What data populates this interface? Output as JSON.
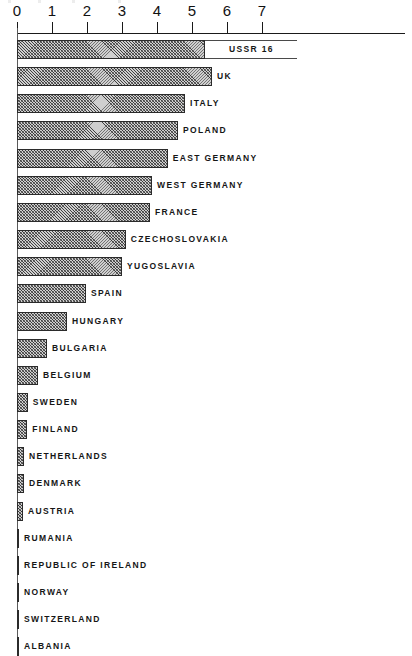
{
  "chart_data": {
    "type": "bar",
    "orientation": "horizontal",
    "title": "",
    "subtitle": "",
    "xlabel": "",
    "ylabel": "",
    "xlim": [
      0,
      7.6
    ],
    "grid": false,
    "legend": null,
    "axis_position": "top",
    "tick_labels": [
      "0",
      "1",
      "2",
      "3",
      "4",
      "5",
      "6",
      "7"
    ],
    "ticks": [
      0,
      1,
      2,
      3,
      4,
      5,
      6,
      7
    ],
    "note": "USSR bar is drawn broken/truncated; its true value 16 is printed as a data label",
    "categories": [
      "USSR",
      "UK",
      "ITALY",
      "POLAND",
      "EAST GERMANY",
      "WEST GERMANY",
      "FRANCE",
      "CZECHOSLOVAKIA",
      "YUGOSLAVIA",
      "SPAIN",
      "HUNGARY",
      "BULGARIA",
      "BELGIUM",
      "SWEDEN",
      "FINLAND",
      "NETHERLANDS",
      "DENMARK",
      "AUSTRIA",
      "RUMANIA",
      "REPUBLIC OF IRELAND",
      "NORWAY",
      "SWITZERLAND",
      "ALBANIA"
    ],
    "values": [
      16.0,
      5.57,
      4.8,
      4.6,
      4.31,
      3.86,
      3.8,
      3.11,
      3.0,
      1.97,
      1.43,
      0.86,
      0.6,
      0.31,
      0.29,
      0.2,
      0.2,
      0.17,
      0.06,
      0.04,
      0.03,
      0.02,
      0.02
    ],
    "bars": [
      {
        "label": "USSR 16",
        "value": 16.0,
        "drawn_value": 5.37,
        "break_end": 8.0,
        "broken": true,
        "label_inside": true
      },
      {
        "label": "UK",
        "value": 5.57,
        "drawn_value": 5.57,
        "broken": false,
        "label_inside": false
      },
      {
        "label": "ITALY",
        "value": 4.8,
        "drawn_value": 4.8,
        "broken": false,
        "label_inside": false
      },
      {
        "label": "POLAND",
        "value": 4.6,
        "drawn_value": 4.6,
        "broken": false,
        "label_inside": false
      },
      {
        "label": "EAST GERMANY",
        "value": 4.31,
        "drawn_value": 4.31,
        "broken": false,
        "label_inside": false
      },
      {
        "label": "WEST GERMANY",
        "value": 3.86,
        "drawn_value": 3.86,
        "broken": false,
        "label_inside": false
      },
      {
        "label": "FRANCE",
        "value": 3.8,
        "drawn_value": 3.8,
        "broken": false,
        "label_inside": false
      },
      {
        "label": "CZECHOSLOVAKIA",
        "value": 3.11,
        "drawn_value": 3.11,
        "broken": false,
        "label_inside": false
      },
      {
        "label": "YUGOSLAVIA",
        "value": 3.0,
        "drawn_value": 3.0,
        "broken": false,
        "label_inside": false
      },
      {
        "label": "SPAIN",
        "value": 1.97,
        "drawn_value": 1.97,
        "broken": false,
        "label_inside": false
      },
      {
        "label": "HUNGARY",
        "value": 1.43,
        "drawn_value": 1.43,
        "broken": false,
        "label_inside": false
      },
      {
        "label": "BULGARIA",
        "value": 0.86,
        "drawn_value": 0.86,
        "broken": false,
        "label_inside": false
      },
      {
        "label": "BELGIUM",
        "value": 0.6,
        "drawn_value": 0.6,
        "broken": false,
        "label_inside": false
      },
      {
        "label": "SWEDEN",
        "value": 0.31,
        "drawn_value": 0.31,
        "broken": false,
        "label_inside": false
      },
      {
        "label": "FINLAND",
        "value": 0.29,
        "drawn_value": 0.29,
        "broken": false,
        "label_inside": false
      },
      {
        "label": "NETHERLANDS",
        "value": 0.2,
        "drawn_value": 0.2,
        "broken": false,
        "label_inside": false
      },
      {
        "label": "DENMARK",
        "value": 0.2,
        "drawn_value": 0.2,
        "broken": false,
        "label_inside": false
      },
      {
        "label": "AUSTRIA",
        "value": 0.17,
        "drawn_value": 0.17,
        "broken": false,
        "label_inside": false
      },
      {
        "label": "RUMANIA",
        "value": 0.06,
        "drawn_value": 0.06,
        "broken": false,
        "label_inside": false
      },
      {
        "label": "REPUBLIC OF IRELAND",
        "value": 0.04,
        "drawn_value": 0.04,
        "broken": false,
        "label_inside": false
      },
      {
        "label": "NORWAY",
        "value": 0.03,
        "drawn_value": 0.03,
        "broken": false,
        "label_inside": false
      },
      {
        "label": "SWITZERLAND",
        "value": 0.02,
        "drawn_value": 0.02,
        "broken": false,
        "label_inside": false
      },
      {
        "label": "ALBANIA",
        "value": 0.02,
        "drawn_value": 0.02,
        "broken": false,
        "label_inside": false
      }
    ]
  }
}
